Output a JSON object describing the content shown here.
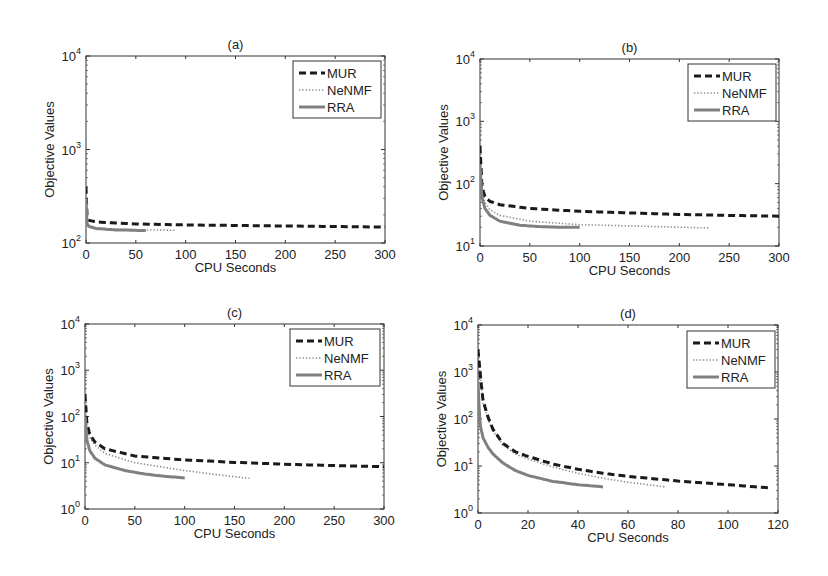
{
  "figure": {
    "legend_labels": [
      "MUR",
      "NeNMF",
      "RRA"
    ]
  },
  "chart_data": [
    {
      "type": "line",
      "panel": "(a)",
      "title": "(a)",
      "xlabel": "CPU Seconds",
      "ylabel": "Objective Values",
      "xlim": [
        0,
        300
      ],
      "ylim": [
        100,
        10000
      ],
      "yscale": "log",
      "xticks": [
        0,
        50,
        100,
        150,
        200,
        250,
        300
      ],
      "yticks": [
        "10^2",
        "10^3",
        "10^4"
      ],
      "legend_position": "upper right",
      "grid": false,
      "series": [
        {
          "name": "MUR",
          "style": "dashed",
          "x": [
            0,
            1,
            3,
            10,
            50,
            100,
            200,
            300
          ],
          "y": [
            400,
            200,
            175,
            168,
            160,
            156,
            152,
            148
          ]
        },
        {
          "name": "NeNMF",
          "style": "dotted",
          "x": [
            0,
            1,
            3,
            10,
            30,
            60,
            90
          ],
          "y": [
            300,
            170,
            155,
            145,
            140,
            138,
            137
          ]
        },
        {
          "name": "RRA",
          "style": "solid",
          "x": [
            0,
            1,
            3,
            10,
            30,
            60
          ],
          "y": [
            300,
            160,
            150,
            143,
            138,
            136
          ]
        }
      ]
    },
    {
      "type": "line",
      "panel": "(b)",
      "title": "(b)",
      "xlabel": "CPU Seconds",
      "ylabel": "Objective Values",
      "xlim": [
        0,
        300
      ],
      "ylim": [
        10,
        10000
      ],
      "yscale": "log",
      "xticks": [
        0,
        50,
        100,
        150,
        200,
        250,
        300
      ],
      "yticks": [
        "10^1",
        "10^2",
        "10^3",
        "10^4"
      ],
      "legend_position": "upper right",
      "grid": false,
      "series": [
        {
          "name": "MUR",
          "style": "dashed",
          "x": [
            0,
            2,
            5,
            10,
            20,
            50,
            100,
            150,
            200,
            250,
            300
          ],
          "y": [
            400,
            90,
            62,
            52,
            46,
            40,
            36,
            34,
            32,
            31,
            30
          ]
        },
        {
          "name": "NeNMF",
          "style": "dotted",
          "x": [
            0,
            2,
            5,
            10,
            20,
            50,
            100,
            150,
            200,
            230
          ],
          "y": [
            300,
            75,
            50,
            38,
            31,
            25,
            22,
            21,
            20,
            19.5
          ]
        },
        {
          "name": "RRA",
          "style": "solid",
          "x": [
            0,
            2,
            5,
            10,
            20,
            40,
            60,
            80,
            100
          ],
          "y": [
            200,
            60,
            40,
            31,
            25,
            21.5,
            20.5,
            20,
            20
          ]
        }
      ]
    },
    {
      "type": "line",
      "panel": "(c)",
      "title": "(c)",
      "xlabel": "CPU Seconds",
      "ylabel": "Objective Values",
      "xlim": [
        0,
        300
      ],
      "ylim": [
        1,
        10000
      ],
      "yscale": "log",
      "xticks": [
        0,
        50,
        100,
        150,
        200,
        250,
        300
      ],
      "yticks": [
        "10^0",
        "10^1",
        "10^2",
        "10^3",
        "10^4"
      ],
      "legend_position": "upper right",
      "grid": false,
      "series": [
        {
          "name": "MUR",
          "style": "dashed",
          "x": [
            0,
            2,
            5,
            10,
            20,
            50,
            100,
            150,
            200,
            250,
            300
          ],
          "y": [
            300,
            70,
            40,
            28,
            20,
            14,
            11.5,
            10.2,
            9.3,
            8.7,
            8.2
          ]
        },
        {
          "name": "NeNMF",
          "style": "dotted",
          "x": [
            0,
            2,
            5,
            10,
            20,
            50,
            100,
            130,
            165
          ],
          "y": [
            250,
            60,
            35,
            24,
            16,
            10,
            6.8,
            5.6,
            4.6
          ]
        },
        {
          "name": "RRA",
          "style": "solid",
          "x": [
            0,
            2,
            5,
            10,
            20,
            40,
            60,
            80,
            100
          ],
          "y": [
            100,
            30,
            18,
            12.5,
            9,
            6.8,
            5.7,
            5.1,
            4.7
          ]
        }
      ]
    },
    {
      "type": "line",
      "panel": "(d)",
      "title": "(d)",
      "xlabel": "CPU Seconds",
      "ylabel": "Objective Values",
      "xlim": [
        0,
        120
      ],
      "ylim": [
        1,
        10000
      ],
      "yscale": "log",
      "xticks": [
        0,
        20,
        40,
        60,
        80,
        100,
        120
      ],
      "yticks": [
        "10^0",
        "10^1",
        "10^2",
        "10^3",
        "10^4"
      ],
      "legend_position": "upper right",
      "grid": false,
      "series": [
        {
          "name": "MUR",
          "style": "dashed",
          "x": [
            0,
            1,
            2,
            4,
            6,
            10,
            15,
            20,
            30,
            40,
            50,
            60,
            80,
            100,
            117
          ],
          "y": [
            3000,
            800,
            250,
            110,
            60,
            30,
            20,
            16,
            11,
            8.5,
            7,
            6,
            4.8,
            4,
            3.4
          ]
        },
        {
          "name": "NeNMF",
          "style": "dotted",
          "x": [
            0,
            1,
            2,
            4,
            6,
            10,
            15,
            20,
            30,
            40,
            50,
            60,
            75
          ],
          "y": [
            2500,
            700,
            220,
            100,
            55,
            28,
            18,
            14,
            9.5,
            7,
            5.5,
            4.5,
            3.6
          ]
        },
        {
          "name": "RRA",
          "style": "solid",
          "x": [
            0,
            0.5,
            1,
            2,
            4,
            6,
            10,
            15,
            20,
            30,
            40,
            50
          ],
          "y": [
            600,
            150,
            70,
            40,
            25,
            18,
            11.5,
            8,
            6.3,
            4.7,
            4,
            3.6
          ]
        }
      ]
    }
  ],
  "panels_layout": [
    {
      "left": 86,
      "top": 56,
      "width": 299,
      "height": 187,
      "legend": {
        "x": 293,
        "y": 61,
        "w": 88,
        "h": 57
      }
    },
    {
      "left": 480,
      "top": 59,
      "width": 299,
      "height": 187,
      "legend": {
        "x": 688,
        "y": 64,
        "w": 88,
        "h": 57
      }
    },
    {
      "left": 85,
      "top": 324,
      "width": 299,
      "height": 185,
      "legend": {
        "x": 290,
        "y": 329,
        "w": 90,
        "h": 57
      }
    },
    {
      "left": 478,
      "top": 325,
      "width": 300,
      "height": 188,
      "legend": {
        "x": 687,
        "y": 331,
        "w": 88,
        "h": 57
      }
    }
  ]
}
